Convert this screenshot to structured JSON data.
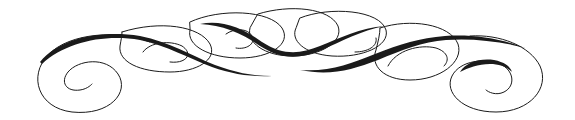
{
  "image": {
    "description": "Decorative calligraphic flourish divider",
    "stroke_color": "#1a1a1a",
    "background": "#ffffff"
  }
}
